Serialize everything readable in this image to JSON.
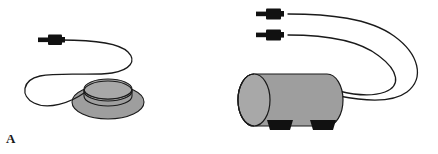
{
  "figure": {
    "width": 438,
    "height": 154,
    "background_color": "#ffffff",
    "type": "two-panel line illustration of electrode/applicator devices"
  },
  "colors": {
    "outline": "#1a1a1a",
    "cable_stroke": "#1a1a1a",
    "connector_black": "#111111",
    "device_gray": "#9e9e9e",
    "device_gray_shadow": "#8f8f8f",
    "device_gray_light": "#a8a8a8",
    "background": "#ffffff",
    "label_color": "#1a1a1a"
  },
  "panels": [
    {
      "id": "a",
      "label": "A",
      "device_name": "disc-coil-applicator",
      "device_description": "flat circular gray pad with raised inner ring",
      "cable_count": 1,
      "connector_count": 1,
      "connectors": [
        {
          "name": "plug-connector-a1",
          "pin_label": "",
          "body_label": ""
        }
      ]
    },
    {
      "id": "b",
      "label": "B",
      "device_name": "cylinder-applicator",
      "device_description": "horizontal gray cylinder with two black mounting feet",
      "cable_count": 2,
      "connector_count": 2,
      "feet_count": 2,
      "connectors": [
        {
          "name": "plug-connector-b1",
          "pin_label": "",
          "body_label": ""
        },
        {
          "name": "plug-connector-b2",
          "pin_label": "",
          "body_label": ""
        }
      ]
    }
  ]
}
